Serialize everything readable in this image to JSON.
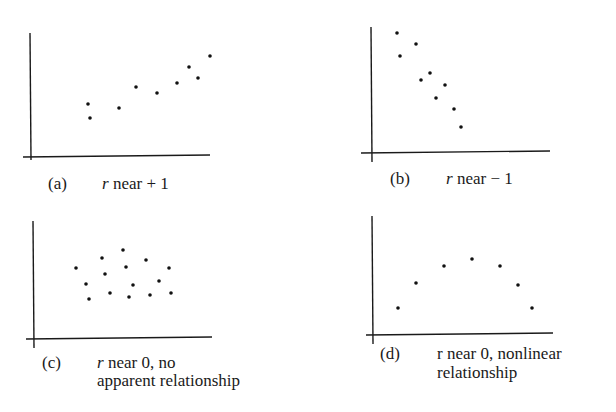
{
  "chart_data": [
    {
      "type": "scatter",
      "panel": "a",
      "tag": "(a)",
      "caption": [
        "r near + 1"
      ],
      "title": "r near + 1",
      "xlabel": "",
      "ylabel": "",
      "grid": false,
      "axes": {
        "origin": [
          30,
          156
        ],
        "x_end": 210,
        "y_top": 33,
        "x_start": 23,
        "y_bottom": 160
      },
      "points": [
        [
          88,
          104
        ],
        [
          90,
          118
        ],
        [
          119,
          108
        ],
        [
          136,
          87
        ],
        [
          157,
          93
        ],
        [
          177,
          83
        ],
        [
          189,
          67
        ],
        [
          198,
          78
        ],
        [
          210,
          56
        ]
      ]
    },
    {
      "type": "scatter",
      "panel": "b",
      "tag": "(b)",
      "caption": [
        "r near − 1"
      ],
      "title": "r near - 1",
      "xlabel": "",
      "ylabel": "",
      "grid": false,
      "axes": {
        "origin": [
          371,
          152
        ],
        "x_end": 550,
        "y_top": 27,
        "x_start": 361,
        "y_bottom": 162
      },
      "points": [
        [
          397,
          33
        ],
        [
          400,
          56
        ],
        [
          416,
          44
        ],
        [
          421,
          80
        ],
        [
          430,
          73
        ],
        [
          436,
          98
        ],
        [
          445,
          85
        ],
        [
          454,
          109
        ],
        [
          461,
          127
        ]
      ]
    },
    {
      "type": "scatter",
      "panel": "c",
      "tag": "(c)",
      "caption": [
        "r near 0, no",
        "apparent relationship"
      ],
      "title": "r near 0, no apparent relationship",
      "xlabel": "",
      "ylabel": "",
      "grid": false,
      "axes": {
        "origin": [
          33,
          338
        ],
        "x_end": 212,
        "y_top": 221,
        "x_start": 26,
        "y_bottom": 348
      },
      "points": [
        [
          76,
          268
        ],
        [
          86,
          284
        ],
        [
          89,
          299
        ],
        [
          102,
          258
        ],
        [
          105,
          274
        ],
        [
          110,
          293
        ],
        [
          123,
          250
        ],
        [
          126,
          267
        ],
        [
          129,
          297
        ],
        [
          133,
          285
        ],
        [
          146,
          260
        ],
        [
          150,
          295
        ],
        [
          159,
          281
        ],
        [
          169,
          268
        ],
        [
          171,
          293
        ]
      ]
    },
    {
      "type": "scatter",
      "panel": "d",
      "tag": "(d)",
      "caption": [
        "r near 0, nonlinear",
        "relationship"
      ],
      "title": "r near 0, nonlinear relationship",
      "xlabel": "",
      "ylabel": "",
      "grid": false,
      "axes": {
        "origin": [
          372,
          334
        ],
        "x_end": 553,
        "y_top": 216,
        "x_start": 366,
        "y_bottom": 344
      },
      "points": [
        [
          398,
          308
        ],
        [
          416,
          283
        ],
        [
          444,
          266
        ],
        [
          472,
          259
        ],
        [
          500,
          266
        ],
        [
          518,
          285
        ],
        [
          532,
          308
        ]
      ]
    }
  ],
  "figure": {
    "panels": [
      {
        "tag": "(a)",
        "caption_line1_r": "r",
        "caption_line1_rest": " near + 1",
        "caption_line2": ""
      },
      {
        "tag": "(b)",
        "caption_line1_r": "r",
        "caption_line1_rest": " near − 1",
        "caption_line2": ""
      },
      {
        "tag": "(c)",
        "caption_line1_r": "r",
        "caption_line1_rest": " near 0, no",
        "caption_line2": "apparent relationship"
      },
      {
        "tag": "(d)",
        "caption_line1_r": "r",
        "caption_line1_rest": " near 0, nonlinear",
        "caption_line2": "relationship"
      }
    ]
  }
}
